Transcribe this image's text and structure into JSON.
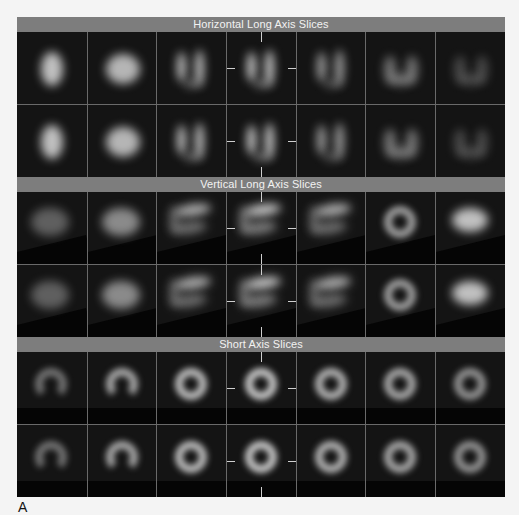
{
  "figure_label": "A",
  "sections": [
    {
      "title": "Horizontal Long Axis Slices",
      "type": "hla",
      "rows": 2,
      "columns": 7
    },
    {
      "title": "Vertical Long Axis Slices",
      "type": "vla",
      "rows": 2,
      "columns": 7
    },
    {
      "title": "Short Axis Slices",
      "type": "sa",
      "rows": 2,
      "columns": 7
    }
  ],
  "colors": {
    "header_bar": "#7d7d7d",
    "header_text": "#f2f2f2",
    "image_bg": "#141414",
    "grid_line": "#6a6a6a",
    "marker": "#cfcfcf"
  }
}
